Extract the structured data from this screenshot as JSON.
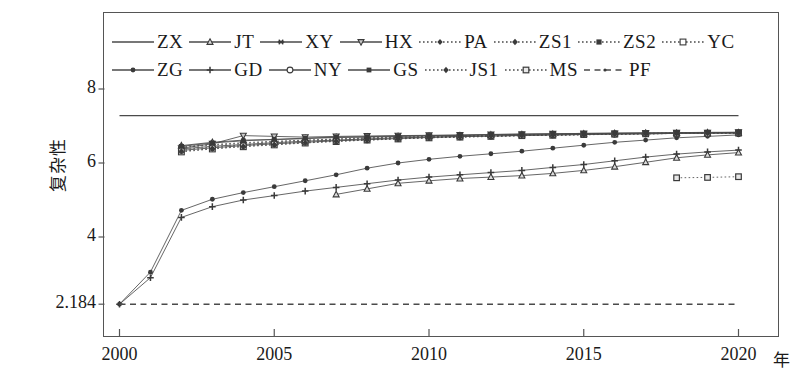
{
  "axes": {
    "ylabel": "复杂性",
    "xlabel": "年",
    "yticks": [
      "8",
      "6",
      "4",
      "2.184"
    ],
    "ytick_values": [
      8,
      6,
      4,
      2.184
    ],
    "xticks": [
      "2000",
      "2005",
      "2010",
      "2015",
      "2020"
    ],
    "xtick_values": [
      2000,
      2005,
      2010,
      2015,
      2020
    ]
  },
  "legend": {
    "row1": [
      "ZX",
      "JT",
      "XY",
      "HX",
      "PA",
      "ZS1",
      "ZS2",
      "YC"
    ],
    "row2": [
      "ZG",
      "GD",
      "NY",
      "GS",
      "JS1",
      "MS",
      "PF"
    ]
  },
  "colors": {
    "line": "#4a4a4a",
    "marker": "#3a3a3a",
    "axis": "#555555",
    "background": "#ffffff"
  },
  "chart_data": {
    "type": "line",
    "title": "",
    "xlabel": "年",
    "ylabel": "复杂性",
    "xlim": [
      2000,
      2021.3
    ],
    "ylim": [
      1.55,
      8.55
    ],
    "grid": false,
    "legend_position": "top",
    "x": [
      2000,
      2001,
      2002,
      2003,
      2004,
      2005,
      2006,
      2007,
      2008,
      2009,
      2010,
      2011,
      2012,
      2013,
      2014,
      2015,
      2016,
      2017,
      2018,
      2019,
      2020
    ],
    "series": [
      {
        "name": "ZX",
        "marker": "none",
        "dash": "solid",
        "values": [
          7.28,
          7.28,
          7.28,
          7.28,
          7.28,
          7.28,
          7.28,
          7.28,
          7.28,
          7.28,
          7.28,
          7.28,
          7.28,
          7.28,
          7.28,
          7.28,
          7.28,
          7.28,
          7.28,
          7.28,
          7.28
        ]
      },
      {
        "name": "JT",
        "marker": "triangle-up",
        "dash": "solid",
        "values": [
          null,
          null,
          6.47,
          6.56,
          6.62,
          6.63,
          6.66,
          6.69,
          6.7,
          6.72,
          6.73,
          6.74,
          6.76,
          6.77,
          6.78,
          6.79,
          6.8,
          6.81,
          6.81,
          6.82,
          6.82
        ]
      },
      {
        "name": "XY",
        "marker": "star",
        "dash": "solid",
        "values": [
          null,
          null,
          6.38,
          6.45,
          6.5,
          6.55,
          6.59,
          6.62,
          6.65,
          6.68,
          6.7,
          6.72,
          6.73,
          6.75,
          6.76,
          6.77,
          6.78,
          6.79,
          6.8,
          6.81,
          6.81
        ]
      },
      {
        "name": "HX",
        "marker": "triangle-down",
        "dash": "solid",
        "values": [
          null,
          null,
          6.4,
          6.52,
          6.74,
          6.72,
          6.7,
          6.72,
          6.73,
          6.74,
          6.75,
          6.76,
          6.77,
          6.78,
          6.79,
          6.8,
          6.8,
          6.81,
          6.82,
          6.82,
          6.83
        ]
      },
      {
        "name": "PA",
        "marker": "diamond",
        "dash": "dotted",
        "values": [
          null,
          null,
          6.42,
          6.48,
          6.53,
          6.57,
          6.61,
          6.64,
          6.67,
          6.69,
          6.71,
          6.73,
          6.74,
          6.76,
          6.77,
          6.78,
          6.79,
          6.8,
          6.81,
          6.81,
          6.82
        ]
      },
      {
        "name": "ZS1",
        "marker": "diamond-filled",
        "dash": "dotted",
        "values": [
          null,
          null,
          6.36,
          6.43,
          6.49,
          6.53,
          6.58,
          6.61,
          6.64,
          6.67,
          6.69,
          6.71,
          6.73,
          6.74,
          6.76,
          6.77,
          6.78,
          6.79,
          6.8,
          6.81,
          6.81
        ]
      },
      {
        "name": "ZS2",
        "marker": "square-filled",
        "dash": "dotted",
        "values": [
          null,
          null,
          6.44,
          6.5,
          6.55,
          6.59,
          6.62,
          6.65,
          6.68,
          6.7,
          6.72,
          6.73,
          6.75,
          6.76,
          6.77,
          6.78,
          6.79,
          6.8,
          6.81,
          6.82,
          6.82
        ]
      },
      {
        "name": "YC",
        "marker": "square-open",
        "dash": "dotted",
        "values": [
          null,
          null,
          6.3,
          6.38,
          6.44,
          6.49,
          6.54,
          6.58,
          6.62,
          6.65,
          6.68,
          6.7,
          6.72,
          6.74,
          6.75,
          6.77,
          6.78,
          6.79,
          6.8,
          6.8,
          6.81
        ]
      },
      {
        "name": "ZG",
        "marker": "circle-small",
        "dash": "solid",
        "values": [
          2.184,
          3.05,
          4.72,
          5.02,
          5.2,
          5.36,
          5.52,
          5.68,
          5.86,
          6.0,
          6.1,
          6.18,
          6.25,
          6.32,
          6.4,
          6.48,
          6.56,
          6.62,
          6.68,
          6.72,
          6.76
        ]
      },
      {
        "name": "GD",
        "marker": "plus",
        "dash": "solid",
        "values": [
          2.184,
          2.9,
          4.53,
          4.82,
          5.0,
          5.12,
          5.24,
          5.34,
          5.44,
          5.54,
          5.62,
          5.68,
          5.74,
          5.8,
          5.88,
          5.96,
          6.06,
          6.16,
          6.24,
          6.3,
          6.35
        ]
      },
      {
        "name": "NY",
        "marker": "circle-open",
        "dash": "solid",
        "values": [
          null,
          null,
          6.34,
          6.41,
          6.47,
          6.52,
          6.56,
          6.6,
          6.63,
          6.66,
          6.69,
          6.71,
          6.73,
          6.74,
          6.76,
          6.77,
          6.78,
          6.79,
          6.8,
          6.8,
          6.81
        ]
      },
      {
        "name": "GS",
        "marker": "square-tiny",
        "dash": "solid",
        "values": [
          null,
          null,
          6.45,
          6.54,
          6.6,
          6.64,
          6.67,
          6.7,
          6.71,
          6.73,
          6.74,
          6.75,
          6.77,
          6.78,
          6.79,
          6.8,
          6.81,
          6.81,
          6.82,
          6.83,
          6.83
        ]
      },
      {
        "name": "JS1",
        "marker": "diamond-mid",
        "dash": "dotted",
        "values": [
          null,
          null,
          6.32,
          6.39,
          6.45,
          6.5,
          6.55,
          6.59,
          6.62,
          6.65,
          6.68,
          6.7,
          6.72,
          6.74,
          6.75,
          6.76,
          6.78,
          6.79,
          6.8,
          6.81,
          6.81
        ]
      },
      {
        "name": "MS",
        "marker": "square-dotted",
        "dash": "dotted",
        "values": [
          null,
          null,
          null,
          null,
          null,
          null,
          null,
          null,
          null,
          null,
          null,
          null,
          null,
          null,
          null,
          null,
          null,
          null,
          5.6,
          5.61,
          5.63
        ]
      },
      {
        "name": "PF",
        "marker": "dot",
        "dash": "dashed",
        "values": [
          2.184,
          2.184,
          2.184,
          2.184,
          2.184,
          2.184,
          2.184,
          2.184,
          2.184,
          2.184,
          2.184,
          2.184,
          2.184,
          2.184,
          2.184,
          2.184,
          2.184,
          2.184,
          2.184,
          2.184,
          2.184
        ]
      },
      {
        "name": "ZG-dip",
        "marker": "triangle-up",
        "dash": "solid",
        "hidden_label": true,
        "values": [
          null,
          null,
          null,
          null,
          null,
          null,
          null,
          5.15,
          5.3,
          5.45,
          5.52,
          5.58,
          5.62,
          5.66,
          5.72,
          5.8,
          5.9,
          6.02,
          6.14,
          6.22,
          6.28
        ]
      }
    ]
  }
}
